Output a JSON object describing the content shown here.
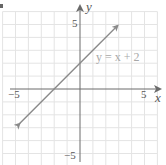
{
  "chart_data": {
    "type": "line",
    "title": "",
    "xlabel": "x",
    "ylabel": "y",
    "xlim": [
      -5,
      5
    ],
    "ylim": [
      -5,
      5
    ],
    "grid": true,
    "x_ticks_labeled": [
      "-5",
      "5"
    ],
    "y_ticks_labeled": [
      "5",
      "-5"
    ],
    "series": [
      {
        "name": "y = x + 2",
        "equation": "y = x + 2",
        "slope": 1,
        "intercept": 2,
        "x": [
          -4.7,
          2.9
        ],
        "y": [
          -2.7,
          4.9
        ],
        "arrows_both_ends": true,
        "color": "#8a8a8a"
      }
    ],
    "annotations": [
      {
        "text": "y = x + 2",
        "x": 3.4,
        "y": 3.2
      }
    ]
  },
  "labels": {
    "x_axis": "x",
    "y_axis": "y",
    "x_min": "−5",
    "x_max": "5",
    "y_max": "5",
    "y_min": "−5",
    "equation": "y = x + 2"
  },
  "colors": {
    "grid": "#e4e4e4",
    "axis": "#6a6a6a",
    "line": "#8a8a8a",
    "text": "#555555",
    "equation": "#a8a8a8"
  }
}
